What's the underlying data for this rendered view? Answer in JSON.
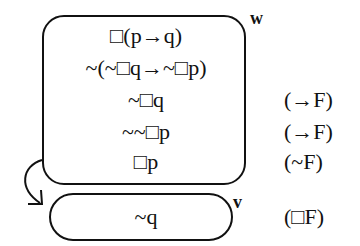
{
  "worlds": [
    {
      "name": "w",
      "formulas": [
        {
          "text": "□(p→q)",
          "rule": ""
        },
        {
          "text": "~(~□q→~□p)",
          "rule": ""
        },
        {
          "text": "~□q",
          "rule": "(→F)"
        },
        {
          "text": "~~□p",
          "rule": "(→F)"
        },
        {
          "text": "□p",
          "rule": "(~F)"
        }
      ]
    },
    {
      "name": "v",
      "formulas": [
        {
          "text": "~q",
          "rule": "(□F)"
        }
      ]
    }
  ],
  "accessibility": {
    "from": "w",
    "to": "v"
  }
}
